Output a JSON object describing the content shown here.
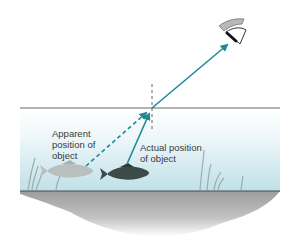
{
  "labels": {
    "apparent": [
      "Apparent",
      "position of",
      "object"
    ],
    "actual": [
      "Actual position",
      "of object"
    ]
  },
  "colors": {
    "ray": "#1f8a96",
    "water_top": "#ffffff",
    "water_bottom": "#bfe0e8",
    "ground": "#a8a8a8",
    "surface_line": "#555555",
    "normal_line": "#555555",
    "fish_actual": "#3c4a4a",
    "fish_apparent": "#b9bfbd"
  },
  "geometry": {
    "surface_y": 108,
    "refraction_point": [
      152,
      108
    ],
    "eye_position": [
      232,
      30
    ],
    "apparent_fish": [
      80,
      168
    ],
    "actual_fish": [
      125,
      168
    ]
  }
}
